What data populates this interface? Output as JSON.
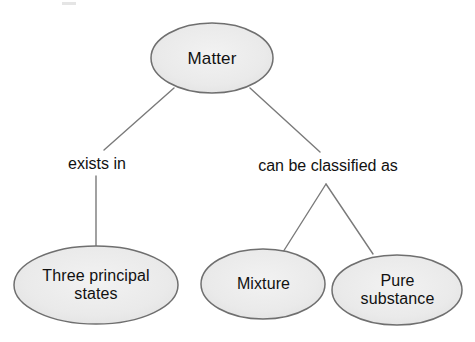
{
  "diagram": {
    "type": "concept-map",
    "background_color": "#ffffff",
    "node_fill_color": "#ebebeb",
    "node_stroke_color": "#6f6f6f",
    "edge_stroke_color": "#7a7a7a",
    "text_color": "#111111",
    "nodes": [
      {
        "id": "matter",
        "label": "Matter",
        "shape": "ellipse",
        "cx": 212,
        "cy": 58,
        "rx": 61,
        "ry": 35
      },
      {
        "id": "three-principal-states",
        "label": "Three principal\nstates",
        "shape": "ellipse",
        "cx": 96,
        "cy": 285,
        "rx": 82,
        "ry": 39
      },
      {
        "id": "mixture",
        "label": "Mixture",
        "shape": "ellipse",
        "cx": 263,
        "cy": 284,
        "rx": 62,
        "ry": 35
      },
      {
        "id": "pure-substance",
        "label": "Pure\nsubstance",
        "shape": "ellipse",
        "cx": 397,
        "cy": 290,
        "rx": 65,
        "ry": 35
      }
    ],
    "edge_labels": [
      {
        "id": "exists-in",
        "text": "exists in",
        "from": "matter",
        "to": "three-principal-states"
      },
      {
        "id": "can-be-classified-as",
        "text": "can be classified as",
        "from": "matter",
        "to": [
          "mixture",
          "pure-substance"
        ]
      }
    ]
  }
}
